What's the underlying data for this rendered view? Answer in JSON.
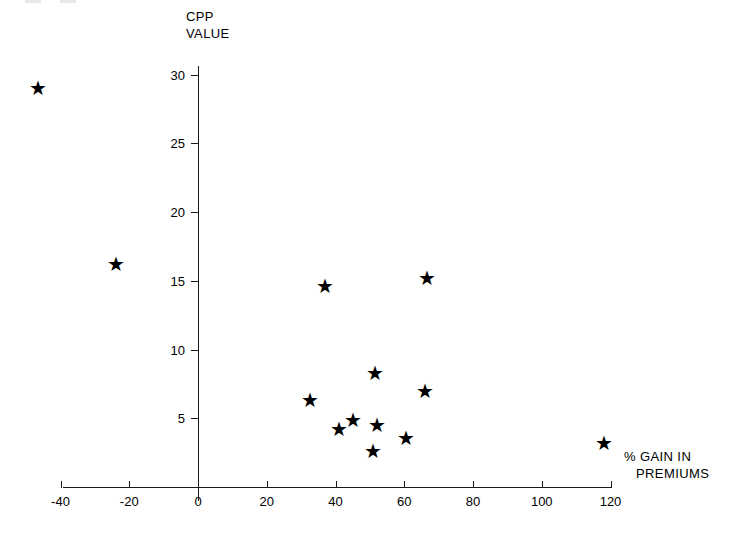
{
  "chart_data": {
    "type": "scatter",
    "title": "",
    "xlabel": "% GAIN IN PREMIUMS",
    "ylabel": "CPP VALUE",
    "xlim": [
      -48,
      124
    ],
    "ylim": [
      0,
      30
    ],
    "xticks": [
      -40,
      -20,
      0,
      20,
      40,
      60,
      80,
      100,
      120
    ],
    "yticks": [
      5,
      10,
      15,
      20,
      25,
      30
    ],
    "xtick_labels": [
      "-40",
      "-20",
      "0",
      "20",
      "40",
      "60",
      "80",
      "100",
      "120"
    ],
    "ytick_labels": [
      "5",
      "10",
      "15",
      "20",
      "25",
      "30"
    ],
    "grid": false,
    "legend": false,
    "marker": "star",
    "points": [
      {
        "x": -46.5,
        "y": 29.0
      },
      {
        "x": -24.0,
        "y": 16.2
      },
      {
        "x": 37.0,
        "y": 14.6
      },
      {
        "x": 66.5,
        "y": 15.2
      },
      {
        "x": 51.5,
        "y": 8.3
      },
      {
        "x": 66.0,
        "y": 7.0
      },
      {
        "x": 32.5,
        "y": 6.3
      },
      {
        "x": 41.0,
        "y": 4.2
      },
      {
        "x": 45.0,
        "y": 4.9
      },
      {
        "x": 52.0,
        "y": 4.5
      },
      {
        "x": 60.5,
        "y": 3.6
      },
      {
        "x": 51.0,
        "y": 2.6
      },
      {
        "x": 118.0,
        "y": 3.2
      }
    ]
  },
  "axis_titles": {
    "y_line1": "CPP",
    "y_line2": "VALUE",
    "x_line1": "% GAIN  IN",
    "x_line2": "PREMIUMS"
  },
  "colors": {
    "ink": "#1a1a1a",
    "marker": "#000000",
    "background": "#ffffff"
  },
  "marker_glyph": "★"
}
